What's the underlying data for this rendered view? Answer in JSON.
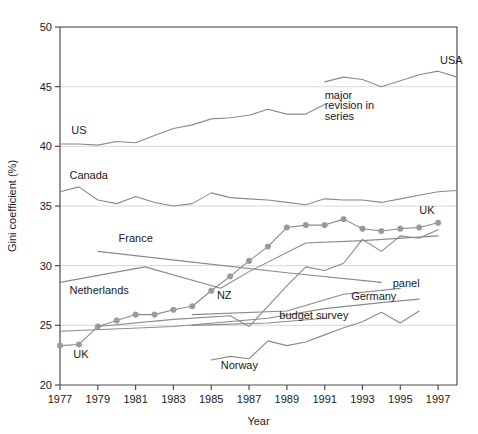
{
  "chart_data": {
    "type": "line",
    "title": "",
    "xlabel": "Year",
    "ylabel": "Gini coefficient (%)",
    "xlim": [
      1977,
      1998
    ],
    "ylim": [
      20,
      50
    ],
    "xticks": [
      1977,
      1979,
      1981,
      1983,
      1985,
      1987,
      1989,
      1991,
      1993,
      1995,
      1997
    ],
    "yticks": [
      20,
      25,
      30,
      35,
      40,
      45,
      50
    ],
    "grid": "horizontal",
    "legend": "inline-labels",
    "line_color": "#8a8a8a",
    "marker_color": "#9a9a9a",
    "axis_color": "#4d4d4d",
    "grid_color": "#d8d8d8",
    "series": [
      {
        "name": "USA",
        "label": "USA",
        "label_x": 1997.1,
        "label_y": 46.9,
        "marker": false,
        "x": [
          1991,
          1992,
          1993,
          1994,
          1995,
          1996,
          1997,
          1998
        ],
        "values": [
          45.4,
          45.8,
          45.6,
          45.0,
          45.5,
          46.0,
          46.3,
          45.8
        ]
      },
      {
        "name": "US",
        "label": "US",
        "label_x": 1977.6,
        "label_y": 41.0,
        "marker": false,
        "x": [
          1977,
          1978,
          1979,
          1980,
          1981,
          1982,
          1983,
          1984,
          1985,
          1986,
          1987,
          1988,
          1989,
          1990,
          1991
        ],
        "values": [
          40.2,
          40.2,
          40.1,
          40.4,
          40.3,
          40.9,
          41.5,
          41.8,
          42.3,
          42.4,
          42.6,
          43.1,
          42.7,
          42.7,
          43.5
        ]
      },
      {
        "name": "Canada",
        "label": "Canada",
        "label_x": 1977.5,
        "label_y": 37.3,
        "marker": false,
        "x": [
          1977,
          1978,
          1979,
          1980,
          1981,
          1982,
          1983,
          1984,
          1985,
          1986,
          1987,
          1988,
          1989,
          1990,
          1991,
          1992,
          1993,
          1994,
          1995,
          1996,
          1997,
          1998
        ],
        "values": [
          36.2,
          36.6,
          35.5,
          35.2,
          35.8,
          35.3,
          35.0,
          35.2,
          36.1,
          35.7,
          35.6,
          35.5,
          35.3,
          35.1,
          35.6,
          35.5,
          35.5,
          35.3,
          35.6,
          35.9,
          36.2,
          36.3
        ]
      },
      {
        "name": "UK",
        "label": "UK",
        "label_x": 1996.0,
        "label_y": 34.3,
        "label2": "UK",
        "label2_x": 1977.7,
        "label2_y": 22.3,
        "marker": true,
        "x": [
          1977,
          1978,
          1979,
          1980,
          1981,
          1982,
          1983,
          1984,
          1985,
          1986,
          1987,
          1988,
          1989,
          1990,
          1991,
          1992,
          1993,
          1994,
          1995,
          1996,
          1997
        ],
        "values": [
          23.3,
          23.4,
          24.9,
          25.4,
          25.9,
          25.9,
          26.3,
          26.6,
          27.9,
          29.1,
          30.4,
          31.6,
          33.2,
          33.4,
          33.4,
          33.9,
          33.1,
          32.9,
          33.1,
          33.2,
          33.6
        ]
      },
      {
        "name": "France",
        "label": "France",
        "label_x": 1980.1,
        "label_y": 32.0,
        "marker": false,
        "x": [
          1979,
          1984,
          1989,
          1994
        ],
        "values": [
          31.2,
          30.3,
          29.4,
          28.6
        ]
      },
      {
        "name": "Netherlands",
        "label": "Netherlands",
        "label_x": 1977.5,
        "label_y": 27.6,
        "marker": false,
        "x": [
          1977,
          1981.5,
          1985.5,
          1987,
          1990,
          1993,
          1997
        ],
        "values": [
          28.6,
          29.9,
          28.1,
          29.5,
          31.9,
          32.1,
          32.5
        ]
      },
      {
        "name": "NZ",
        "label": "NZ",
        "label_x": 1985.3,
        "label_y": 27.2,
        "marker": false,
        "x": [
          1979,
          1983,
          1986,
          1987,
          1988,
          1989,
          1990,
          1991,
          1992,
          1993,
          1994,
          1995,
          1996,
          1997
        ],
        "values": [
          24.9,
          25.5,
          25.8,
          24.9,
          26.6,
          28.3,
          29.9,
          29.6,
          30.2,
          32.2,
          31.2,
          32.5,
          32.3,
          33.0
        ]
      },
      {
        "name": "Germany budget survey",
        "label": "budget survey",
        "label_x": 1988.6,
        "label_y": 25.5,
        "marker": false,
        "x": [
          1977,
          1983,
          1988,
          1991,
          1994,
          1996
        ],
        "values": [
          24.5,
          24.9,
          25.6,
          26.4,
          26.9,
          27.2
        ]
      },
      {
        "name": "Germany panel",
        "label": "panel",
        "label_x": 1994.6,
        "label_y": 28.2,
        "marker": false,
        "x": [
          1984,
          1989,
          1992,
          1995
        ],
        "values": [
          25.9,
          26.2,
          27.6,
          28.1
        ]
      },
      {
        "name": "Germany",
        "label": "Germany",
        "label_x": 1992.4,
        "label_y": 27.1,
        "marker": false,
        "x": [
          1984,
          1988,
          1991
        ],
        "values": [
          25.0,
          25.2,
          25.6
        ]
      },
      {
        "name": "Norway",
        "label": "Norway",
        "label_x": 1985.5,
        "label_y": 21.3,
        "marker": false,
        "x": [
          1985,
          1986,
          1987,
          1988,
          1989,
          1990,
          1991,
          1992,
          1993,
          1994,
          1995,
          1996
        ],
        "values": [
          22.1,
          22.4,
          22.2,
          23.7,
          23.3,
          23.6,
          24.2,
          24.8,
          25.3,
          26.1,
          25.2,
          26.2
        ]
      }
    ],
    "annotations": [
      {
        "text": "major",
        "x": 1991.0,
        "y": 44.0
      },
      {
        "text": "revision in",
        "x": 1991.0,
        "y": 43.1
      },
      {
        "text": "series",
        "x": 1991.0,
        "y": 42.2
      }
    ]
  }
}
